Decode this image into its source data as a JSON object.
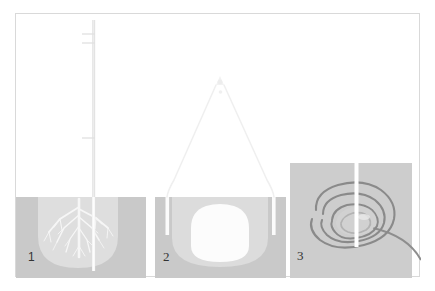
{
  "figure": {
    "panels": [
      {
        "number": "1",
        "name": "panel-drilling-over-root-system",
        "description": "Cross-section of soil with tree root system and vertical drilling mast",
        "elements": [
          "soil-block",
          "root-system",
          "drill-mast",
          "mast-cross-arms",
          "lighter-soil-bowl"
        ]
      },
      {
        "number": "2",
        "name": "panel-cable-frame-over-cavity",
        "description": "Cross-section of soil with excavated dome cavity, two vertical shafts and overhead A-frame cables",
        "elements": [
          "soil-block",
          "cavity-void",
          "left-shaft",
          "right-shaft",
          "a-frame-cable-left",
          "a-frame-cable-right",
          "apex-fitting"
        ]
      },
      {
        "number": "3",
        "name": "panel-spiral-plan-view",
        "description": "Plan view of spiral coil wound around a central vertical pipe on a square ground plate",
        "elements": [
          "ground-plate",
          "spiral-coil",
          "central-pipe",
          "coil-tail"
        ]
      }
    ]
  },
  "colors": {
    "frame_border": "#d9d9d9",
    "background": "#ffffff",
    "soil_dark": "#c8c8c8",
    "soil_light": "#dcdcdc",
    "cavity_white": "#fbfbfb",
    "ground_plate": "#cdcdcd",
    "coil_stroke": "#8c8c8c",
    "pipe_white": "#ffffff",
    "mast_gray": "#e2e2e2",
    "label_text": "#333333"
  }
}
